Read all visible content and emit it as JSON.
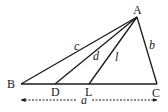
{
  "diagram": {
    "type": "triangle-with-cevians",
    "points": {
      "A": {
        "label": "A",
        "x": 137,
        "y": 17
      },
      "B": {
        "label": "B",
        "x": 21,
        "y": 84
      },
      "C": {
        "label": "C",
        "x": 157,
        "y": 84
      },
      "D": {
        "label": "D",
        "x": 55,
        "y": 84
      },
      "L": {
        "label": "L",
        "x": 89,
        "y": 84
      }
    },
    "segments": [
      {
        "from": "A",
        "to": "B",
        "label": "c"
      },
      {
        "from": "A",
        "to": "C",
        "label": "b"
      },
      {
        "from": "B",
        "to": "C",
        "label": ""
      },
      {
        "from": "A",
        "to": "D",
        "label": "d"
      },
      {
        "from": "A",
        "to": "L",
        "label": "l"
      }
    ],
    "side_labels": {
      "c": "c",
      "b": "b",
      "d": "d",
      "l": "l",
      "a": "a"
    },
    "dimension": {
      "label": "a",
      "from": "B",
      "to": "C"
    },
    "colors": {
      "stroke": "#1a1a1a",
      "background": "#ffffff"
    }
  }
}
